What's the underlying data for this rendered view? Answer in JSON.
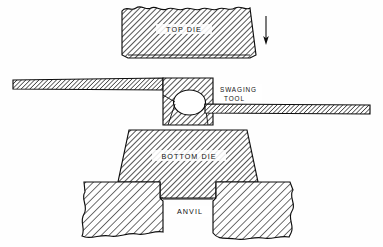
{
  "figure": {
    "background_color": "#fefefe",
    "line_color": "#0d0d0d",
    "hatch_color": "#1a1a1a"
  },
  "labels": {
    "top_die": "TOP   DIE",
    "swaging_tool_line1": "SWAGING",
    "swaging_tool_line2": "TOOL",
    "bottom_die": "BOTTOM DIE",
    "anvil": "ANVIL"
  },
  "parts": [
    {
      "name": "top-die",
      "label": "TOP   DIE",
      "shape": "trapezoid-wide-top",
      "broken_edge": "top",
      "hatch": "diagonal-backslash-dense"
    },
    {
      "name": "swaging-tool-body",
      "label": "SWAGING TOOL",
      "shape": "block-with-circular-bore",
      "hatch": "diagonal-backslash-dense"
    },
    {
      "name": "swaging-tool-left-bar",
      "label": "",
      "shape": "thin-horizontal-bar",
      "hatch": "diagonal-backslash-dense"
    },
    {
      "name": "swaging-tool-right-bar",
      "label": "",
      "shape": "thin-horizontal-bar",
      "hatch": "diagonal-backslash-dense"
    },
    {
      "name": "workpiece-bore",
      "label": "",
      "shape": "ellipse",
      "hatch": "none"
    },
    {
      "name": "bottom-die",
      "label": "BOTTOM DIE",
      "shape": "trapezoid-wide-top-with-stem",
      "hatch": "diagonal-backslash-dense"
    },
    {
      "name": "anvil",
      "label": "ANVIL",
      "shape": "broken-block-with-recess",
      "broken_edge": "left-right-bottom",
      "hatch": "diagonal-backslash-sparse"
    },
    {
      "name": "motion-arrow",
      "label": "",
      "shape": "down-arrow",
      "hatch": "none"
    }
  ],
  "annotations": {
    "motion_arrow_direction": "down"
  }
}
